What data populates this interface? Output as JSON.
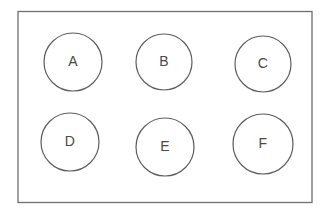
{
  "diagram": {
    "background_color": "#ffffff",
    "frame": {
      "name": "outer-rectangle",
      "x": 18,
      "y": 11.5,
      "width": 294,
      "height": 191,
      "stroke_color": "#6f6f6f",
      "stroke_width": 1.3,
      "fill_color": "#ffffff"
    },
    "node_style": {
      "stroke_color": "#5d5d5d",
      "stroke_width": 1.2,
      "fill_color": "#ffffff",
      "label_color": "#4a4a4a",
      "label_font_size": 14
    },
    "grid": {
      "rows": 2,
      "columns": 3
    },
    "nodes": [
      {
        "id": "A",
        "label": "A",
        "cx": 73,
        "cy": 62,
        "r": 29,
        "row": 1,
        "column": 1
      },
      {
        "id": "B",
        "label": "B",
        "cx": 164,
        "cy": 62,
        "r": 28,
        "row": 1,
        "column": 2
      },
      {
        "id": "C",
        "label": "C",
        "cx": 263,
        "cy": 64,
        "r": 28,
        "row": 1,
        "column": 3
      },
      {
        "id": "D",
        "label": "D",
        "cx": 70,
        "cy": 142,
        "r": 29,
        "row": 2,
        "column": 1
      },
      {
        "id": "E",
        "label": "E",
        "cx": 165,
        "cy": 147,
        "r": 29,
        "row": 2,
        "column": 2
      },
      {
        "id": "F",
        "label": "F",
        "cx": 263,
        "cy": 144,
        "r": 30,
        "row": 2,
        "column": 3
      }
    ]
  }
}
